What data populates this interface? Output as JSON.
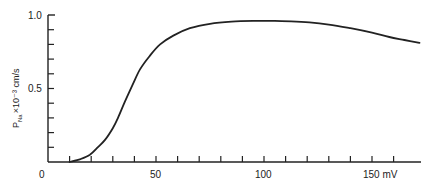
{
  "chart_data": {
    "type": "line",
    "title": "",
    "xlabel": "mV",
    "ylabel": "P_Na × 10⁻³ cm/s",
    "xlim": [
      0,
      174
    ],
    "ylim": [
      0,
      1.0
    ],
    "grid": false,
    "legend": null,
    "x_tick_labels": [
      {
        "value": 0,
        "label": "0"
      },
      {
        "value": 50,
        "label": "50"
      },
      {
        "value": 100,
        "label": "100"
      },
      {
        "value": 150,
        "label": "150 mV"
      }
    ],
    "x_minor_ticks_every": 10,
    "y_tick_labels": [
      {
        "value": 0,
        "label": "0"
      },
      {
        "value": 0.5,
        "label": "0.5"
      },
      {
        "value": 1.0,
        "label": "1.0"
      }
    ],
    "y_minor_ticks_every": 0.1,
    "series": [
      {
        "name": "P_Na",
        "color": "#222222",
        "x": [
          10,
          15,
          19.4,
          23,
          26.4,
          30,
          32.4,
          35.6,
          39,
          42.6,
          47,
          51.9,
          58,
          65.7,
          75,
          85,
          95,
          105,
          115,
          121,
          130,
          140,
          150,
          158,
          165,
          172
        ],
        "y": [
          0.0,
          0.02,
          0.05,
          0.1,
          0.15,
          0.23,
          0.3,
          0.41,
          0.52,
          0.63,
          0.72,
          0.8,
          0.86,
          0.91,
          0.94,
          0.955,
          0.96,
          0.96,
          0.955,
          0.95,
          0.935,
          0.91,
          0.88,
          0.85,
          0.83,
          0.81
        ]
      }
    ]
  },
  "labels": {
    "ylabel_main": "P",
    "ylabel_sub": "Na",
    "ylabel_rest": "×10⁻³ cm/s",
    "x0": "0",
    "x50": "50",
    "x100": "100",
    "x150": "150 mV",
    "y0": "0",
    "y05": "0.5",
    "y10": "1.0"
  }
}
